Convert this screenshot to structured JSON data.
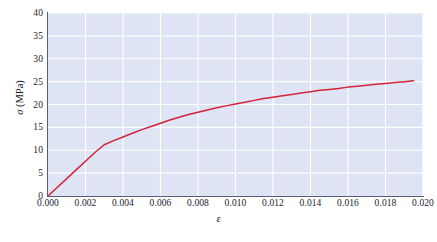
{
  "figure": {
    "background_color": "#ffffff",
    "plot_background_color": "#dfe4f4",
    "grid_color": "#ffffff",
    "axis_color": "#555f7a",
    "curve_color": "#d3223a"
  },
  "axis_titles": {
    "y": "σ (MPa)",
    "x": "ε"
  },
  "y_tick_labels": [
    "40",
    "35",
    "30",
    "25",
    "20",
    "15",
    "10",
    "5",
    "0"
  ],
  "x_tick_labels": [
    "0.000",
    "0.002",
    "0.004",
    "0.006",
    "0.008",
    "0.010",
    "0.012",
    "0.014",
    "0.016",
    "0.018",
    "0.020"
  ],
  "chart_data": {
    "type": "line",
    "title": "",
    "xlabel": "ε",
    "ylabel": "σ (MPa)",
    "xlim": [
      0.0,
      0.02
    ],
    "ylim": [
      0,
      40
    ],
    "xticks": [
      0.0,
      0.002,
      0.004,
      0.006,
      0.008,
      0.01,
      0.012,
      0.014,
      0.016,
      0.018,
      0.02
    ],
    "yticks": [
      0,
      5,
      10,
      15,
      20,
      25,
      30,
      35,
      40
    ],
    "grid": true,
    "legend": null,
    "series": [
      {
        "name": "stress-strain",
        "color": "#d3223a",
        "x": [
          0.0,
          0.0005,
          0.001,
          0.0015,
          0.002,
          0.0025,
          0.003,
          0.0035,
          0.004,
          0.0045,
          0.005,
          0.0055,
          0.006,
          0.0065,
          0.007,
          0.0075,
          0.008,
          0.0085,
          0.009,
          0.0095,
          0.01,
          0.0105,
          0.011,
          0.0115,
          0.012,
          0.0125,
          0.013,
          0.0135,
          0.014,
          0.0145,
          0.015,
          0.0155,
          0.016,
          0.0165,
          0.017,
          0.0175,
          0.018,
          0.0185,
          0.019,
          0.0195
        ],
        "y": [
          0.0,
          1.9,
          3.8,
          5.7,
          7.6,
          9.5,
          11.2,
          12.1,
          12.9,
          13.7,
          14.5,
          15.2,
          15.9,
          16.6,
          17.2,
          17.8,
          18.3,
          18.8,
          19.3,
          19.7,
          20.1,
          20.5,
          20.9,
          21.3,
          21.6,
          21.9,
          22.2,
          22.5,
          22.8,
          23.1,
          23.3,
          23.5,
          23.8,
          24.0,
          24.2,
          24.4,
          24.6,
          24.8,
          25.0,
          25.2
        ]
      }
    ]
  }
}
